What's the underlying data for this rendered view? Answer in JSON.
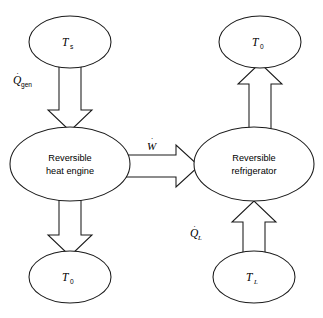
{
  "diagram": {
    "background_color": "#ffffff",
    "stroke_color": "#1a1a1a",
    "fill_color": "#ffffff",
    "nodes": {
      "source_reservoir": {
        "symbol": "T",
        "subscript": "s",
        "subscript_style": "upright",
        "cx": 70,
        "cy": 42,
        "rx": 41,
        "ry": 26
      },
      "heat_engine": {
        "line1": "Reversible",
        "line2": "heat engine",
        "cx": 70,
        "cy": 164,
        "rx": 60,
        "ry": 37
      },
      "engine_sink_reservoir": {
        "symbol": "T",
        "subscript": "0",
        "subscript_style": "upright",
        "cx": 70,
        "cy": 277,
        "rx": 41,
        "ry": 26
      },
      "ambient_reservoir": {
        "symbol": "T",
        "subscript": "0",
        "subscript_style": "upright",
        "cx": 260,
        "cy": 42,
        "rx": 41,
        "ry": 26
      },
      "refrigerator": {
        "line1": "Reversible",
        "line2": "refrigerator",
        "cx": 254,
        "cy": 164,
        "rx": 60,
        "ry": 37
      },
      "cold_reservoir": {
        "symbol": "T",
        "subscript": "L",
        "subscript_style": "italic",
        "cx": 254,
        "cy": 277,
        "rx": 41,
        "ry": 26
      }
    },
    "flows": {
      "heat_in": {
        "symbol": "Q",
        "subscript": "gen",
        "subscript_style": "upright",
        "overdot": true,
        "direction": "down",
        "label_x": 13,
        "label_y": 82
      },
      "heat_rejected_engine": {
        "symbol": "",
        "subscript": "",
        "overdot": false,
        "direction": "down"
      },
      "work": {
        "symbol": "W",
        "subscript": "",
        "overdot": true,
        "direction": "right",
        "label_x": 147,
        "label_y": 148
      },
      "heat_rejected_fridge": {
        "symbol": "",
        "subscript": "",
        "overdot": false,
        "direction": "up"
      },
      "heat_absorbed": {
        "symbol": "Q",
        "subscript": "L",
        "subscript_style": "italic",
        "overdot": true,
        "direction": "up",
        "label_x": 190,
        "label_y": 235
      }
    }
  }
}
